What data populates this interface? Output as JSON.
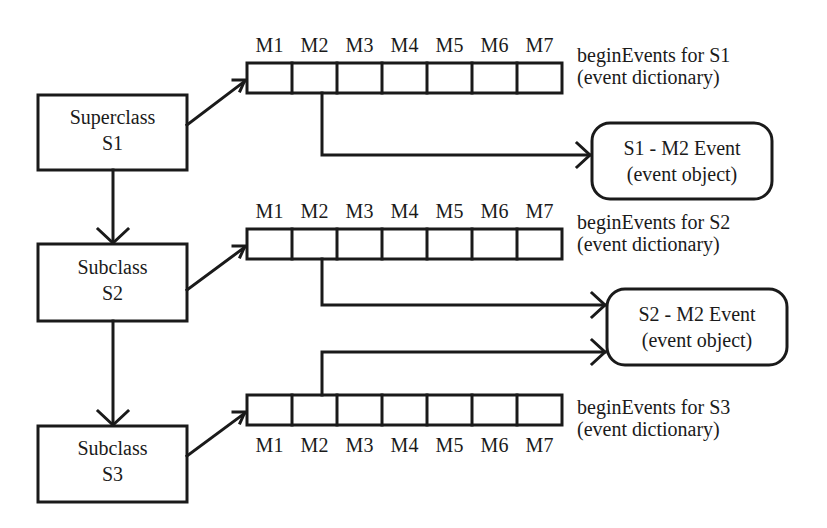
{
  "diagram": {
    "classes": [
      {
        "id": "S1",
        "line1": "Superclass",
        "line2": "S1"
      },
      {
        "id": "S2",
        "line1": "Subclass",
        "line2": "S2"
      },
      {
        "id": "S3",
        "line1": "Subclass",
        "line2": "S3"
      }
    ],
    "method_labels": [
      "M1",
      "M2",
      "M3",
      "M4",
      "M5",
      "M6",
      "M7"
    ],
    "dictionaries": [
      {
        "line1": "beginEvents for S1",
        "line2": "(event dictionary)"
      },
      {
        "line1": "beginEvents for S2",
        "line2": "(event dictionary)"
      },
      {
        "line1": "beginEvents for S3",
        "line2": "(event dictionary)"
      }
    ],
    "event_objects": [
      {
        "line1": "S1 - M2 Event",
        "line2": "(event object)"
      },
      {
        "line1": "S2 - M2 Event",
        "line2": "(event object)"
      }
    ],
    "colors": {
      "stroke": "#1a1a1a",
      "background": "#ffffff"
    }
  }
}
